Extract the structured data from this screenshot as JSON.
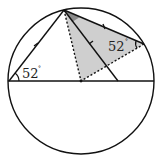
{
  "diagram": {
    "type": "circle-geometry",
    "circle": {
      "cx": 81,
      "cy": 81,
      "r": 73
    },
    "points": {
      "A_top": [
        64,
        10
      ],
      "L_left_on_diameter": [
        9,
        81
      ],
      "O_center": [
        81,
        81
      ],
      "B_on_diameter": [
        118,
        81
      ],
      "C_right_on_circle": [
        144,
        44
      ]
    },
    "angles": {
      "left": {
        "value": "52",
        "unit": "°"
      },
      "right": {
        "value": "52",
        "unit": "°"
      }
    },
    "colors": {
      "stroke": "#111111",
      "shade_light": "#cfcfcf",
      "shade_dark": "#8a8a8a",
      "background": "#ffffff"
    }
  }
}
